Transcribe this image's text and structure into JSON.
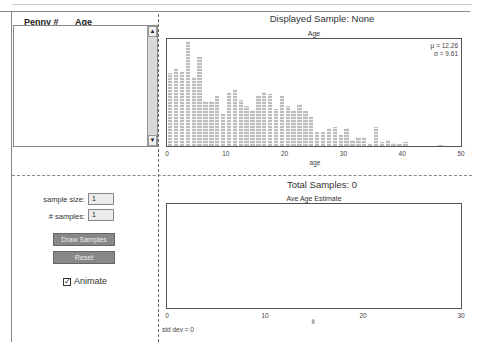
{
  "list": {
    "columns": [
      "Penny #",
      "Age"
    ],
    "rows": []
  },
  "population_panel": {
    "header": "Displayed Sample: None",
    "chart_title": "Age",
    "mu_label": "μ = 12.26",
    "sigma_label": "σ = 9.61",
    "x_label": "age",
    "x_ticks": [
      "0",
      "10",
      "20",
      "30",
      "40",
      "50"
    ]
  },
  "controls": {
    "sample_size_label": "sample size:",
    "sample_size_value": "1",
    "num_samples_label": "# samples:",
    "num_samples_value": "1",
    "draw_button": "Draw Samples",
    "reset_button": "Reset",
    "animate_label": "Animate",
    "animate_checked": true
  },
  "sampling_panel": {
    "header": "Total Samples: 0",
    "chart_title": "Ave Age Estimate",
    "x_label": "x̄",
    "x_ticks": [
      "0",
      "10",
      "20",
      "30"
    ],
    "std_dev_label": "std dev = 0"
  },
  "colors": {
    "bar": "#bdbdbd",
    "button": "#888888",
    "axis": "#555555"
  },
  "chart_data": [
    {
      "type": "bar",
      "title": "Age",
      "xlabel": "age",
      "ylabel": "",
      "xlim": [
        0,
        50
      ],
      "x": [
        0,
        1,
        2,
        3,
        4,
        5,
        6,
        7,
        8,
        9,
        10,
        11,
        12,
        13,
        14,
        15,
        16,
        17,
        18,
        19,
        20,
        21,
        22,
        23,
        24,
        25,
        26,
        27,
        28,
        29,
        30,
        31,
        32,
        33,
        34,
        35,
        36,
        37,
        38,
        39,
        40,
        46
      ],
      "values": [
        74,
        78,
        75,
        106,
        70,
        90,
        45,
        45,
        50,
        32,
        55,
        58,
        46,
        40,
        36,
        50,
        55,
        53,
        37,
        50,
        40,
        36,
        42,
        35,
        30,
        14,
        14,
        18,
        19,
        11,
        18,
        6,
        9,
        9,
        2,
        19,
        4,
        6,
        3,
        2,
        4,
        1
      ],
      "annotations": [
        "μ = 12.26",
        "σ = 9.61"
      ],
      "grid": false
    },
    {
      "type": "bar",
      "title": "Ave Age Estimate",
      "xlabel": "x̄",
      "xlim": [
        0,
        30
      ],
      "x": [],
      "values": [],
      "annotations": [
        "std dev = 0"
      ],
      "grid": false
    }
  ]
}
